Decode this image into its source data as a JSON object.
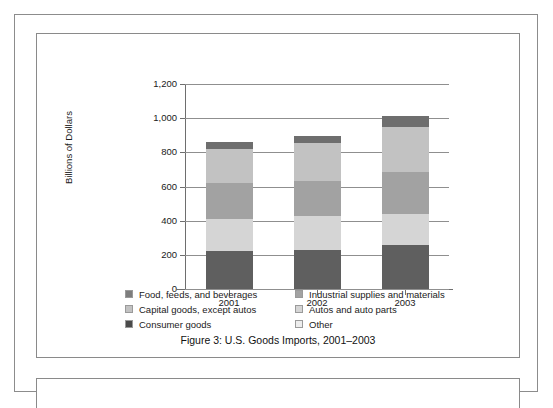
{
  "figure": {
    "caption": "Figure 3:  U.S. Goods Imports, 2001–2003"
  },
  "chart_data": {
    "type": "bar",
    "subtype": "stacked-vertical",
    "title": "",
    "xlabel": "",
    "ylabel": "Billions of Dollars",
    "categories": [
      "2001",
      "2002",
      "2003"
    ],
    "ylim": [
      0,
      1200
    ],
    "yticks": [
      0,
      200,
      400,
      600,
      800,
      1000,
      1200
    ],
    "ytick_labels": [
      "0",
      "200",
      "400",
      "600",
      "800",
      "1,000",
      "1,200"
    ],
    "grid": true,
    "legend_position": "below-plot",
    "stack_order_bottom_to_top": [
      "Consumer goods",
      "Autos and auto parts",
      "Industrial supplies and materials",
      "Capital goods, except autos",
      "Other"
    ],
    "series": [
      {
        "name": "Consumer goods",
        "color": "#5f5f5f",
        "values": [
          220,
          230,
          260
        ]
      },
      {
        "name": "Autos and auto parts",
        "color": "#d5d5d5",
        "values": [
          190,
          200,
          180
        ]
      },
      {
        "name": "Industrial supplies and materials",
        "color": "#a2a2a2",
        "values": [
          210,
          205,
          245
        ]
      },
      {
        "name": "Capital goods, except autos",
        "color": "#c2c2c2",
        "values": [
          200,
          220,
          265
        ]
      },
      {
        "name": "Other",
        "color": "#6e6e6e",
        "values": [
          40,
          40,
          65
        ]
      }
    ],
    "totals": [
      860,
      895,
      1015
    ]
  },
  "legend": {
    "left_column": [
      {
        "label": "Food, feeds, and beverages",
        "color": "#7d7d7d"
      },
      {
        "label": "Capital goods, except autos",
        "color": "#c2c2c2"
      },
      {
        "label": "Consumer goods",
        "color": "#4a4a4a"
      }
    ],
    "right_column": [
      {
        "label": "Industrial supplies and materials",
        "color": "#a2a2a2"
      },
      {
        "label": "Autos and auto parts",
        "color": "#d5d5d5"
      },
      {
        "label": "Other",
        "color": "#ededed"
      }
    ]
  }
}
